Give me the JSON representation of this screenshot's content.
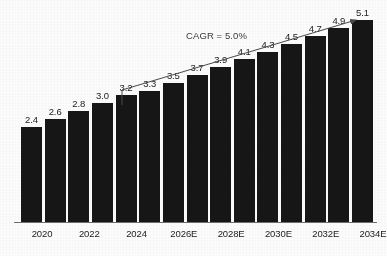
{
  "chart_data": {
    "type": "bar",
    "title": "",
    "subtitle": "",
    "xlabel": "",
    "ylabel": "",
    "grid": false,
    "legend": null,
    "ylim": [
      0,
      5.6
    ],
    "categories": [
      "2020",
      "2021",
      "2022",
      "2023",
      "2024",
      "2025E",
      "2026E",
      "2027E",
      "2028E",
      "2029E",
      "2030E",
      "2031E",
      "2032E",
      "2033E",
      "2034E"
    ],
    "tick_labels": [
      "2020",
      "",
      "2022",
      "",
      "2024",
      "",
      "2026E",
      "",
      "2028E",
      "",
      "2030E",
      "",
      "2032E",
      "",
      "2034E"
    ],
    "values": [
      2.4,
      2.6,
      2.8,
      3.0,
      3.2,
      3.3,
      3.5,
      3.7,
      3.9,
      4.1,
      4.3,
      4.5,
      4.7,
      4.9,
      5.1
    ],
    "value_labels": [
      "2.4",
      "2.6",
      "2.8",
      "3.0",
      "3.2",
      "3.3",
      "3.5",
      "3.7",
      "3.9",
      "4.1",
      "4.3",
      "4.5",
      "4.7",
      "4.9",
      "5.1"
    ],
    "annotations": [
      {
        "name": "cagr-annotation",
        "text": "CAGR = 5.0%",
        "from_category": "2024",
        "to_category": "2034E",
        "value": 5.0,
        "unit": "%"
      }
    ],
    "colors": {
      "bar": "#161616",
      "background": "#fdfdfd",
      "axis": "#6f6f6f",
      "label_text": "#1c1c1c",
      "annotation": "#3b3b3b"
    }
  }
}
